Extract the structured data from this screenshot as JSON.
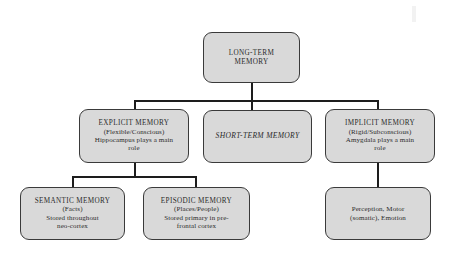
{
  "diagram": {
    "colors": {
      "node_fill": "#d9d9d9",
      "node_border": "#3a3a3a",
      "connector": "#1d1d1d",
      "background": "#ffffff",
      "text": "#2b2b2b"
    },
    "nodes": {
      "long_term_memory": {
        "line1": "LONG-TERM",
        "line2": "MEMORY"
      },
      "explicit_memory": {
        "line1": "EXPLICIT MEMORY",
        "line2": "(Flexible/Conscious)",
        "line3": "Hippocampus plays a main",
        "line4": "role"
      },
      "short_term_memory": {
        "line1": "SHORT-TERM MEMORY"
      },
      "implicit_memory": {
        "line1": "IMPLICIT MEMORY",
        "line2": "(Rigid/Subconscious)",
        "line3": "Amygdala plays a main",
        "line4": "role"
      },
      "semantic_memory": {
        "line1": "SEMANTIC MEMORY",
        "line2": "(Facts)",
        "line3": "Stored throughout",
        "line4": "neo-cortex"
      },
      "episodic_memory": {
        "line1": "EPISODIC MEMORY",
        "line2": "(Places/People)",
        "line3": "Stored primary in pre-",
        "line4": "frontal cortex"
      },
      "implicit_outputs": {
        "line1": "Perception, Motor",
        "line2": "(somatic), Emotion"
      }
    }
  }
}
